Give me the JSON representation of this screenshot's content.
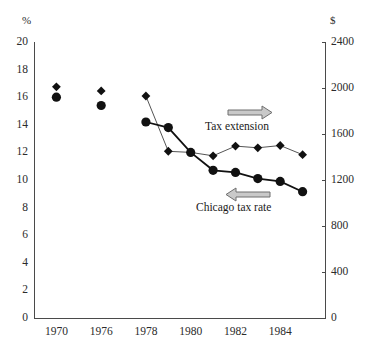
{
  "chart_data": {
    "type": "line",
    "title": "",
    "subtitle": "",
    "xlabel": "",
    "ylabel": "%",
    "y2label": "$",
    "grid": false,
    "legend_position": "inline-annotations",
    "x_tick_labels": [
      "1970",
      "1976",
      "1978",
      "1980",
      "1982",
      "1984"
    ],
    "x_tick_slots": [
      1,
      3,
      5,
      7,
      9,
      11
    ],
    "x_slot_count": 13,
    "left_axis": {
      "label": "%",
      "ticks": [
        "0",
        "2",
        "4",
        "6",
        "8",
        "10",
        "12",
        "14",
        "16",
        "18",
        "20"
      ],
      "values": [
        0,
        2,
        4,
        6,
        8,
        10,
        12,
        14,
        16,
        18,
        20
      ],
      "ylim": [
        0,
        20
      ]
    },
    "right_axis": {
      "label": "$",
      "ticks": [
        "0",
        "400",
        "800",
        "1200",
        "1600",
        "2000",
        "2400"
      ],
      "values": [
        0,
        400,
        800,
        1200,
        1600,
        2000,
        2400
      ],
      "ylim": [
        0,
        2400
      ]
    },
    "series": [
      {
        "name": "Tax extension",
        "axis": "right",
        "marker": "diamond",
        "color": "#111111",
        "line_color": "#555555",
        "points": [
          {
            "x_slot": 1,
            "x_label": "1970",
            "value": 2010,
            "connected": false
          },
          {
            "x_slot": 3,
            "x_label": "1976",
            "value": 1975,
            "connected": false
          },
          {
            "x_slot": 5,
            "x_label": "1978",
            "value": 1930,
            "connected": true
          },
          {
            "x_slot": 6,
            "x_label": "1979",
            "value": 1450,
            "connected": true
          },
          {
            "x_slot": 7,
            "x_label": "1980",
            "value": 1440,
            "connected": true
          },
          {
            "x_slot": 8,
            "x_label": "1981",
            "value": 1410,
            "connected": true
          },
          {
            "x_slot": 9,
            "x_label": "1982",
            "value": 1495,
            "connected": true
          },
          {
            "x_slot": 10,
            "x_label": "1983",
            "value": 1480,
            "connected": true
          },
          {
            "x_slot": 11,
            "x_label": "1984",
            "value": 1500,
            "connected": true
          },
          {
            "x_slot": 12,
            "x_label": "1985",
            "value": 1420,
            "connected": true
          }
        ]
      },
      {
        "name": "Chicago tax rate",
        "axis": "left",
        "marker": "circle",
        "color": "#111111",
        "line_color": "#111111",
        "points": [
          {
            "x_slot": 1,
            "x_label": "1970",
            "value": 16.0,
            "connected": false
          },
          {
            "x_slot": 3,
            "x_label": "1976",
            "value": 15.4,
            "connected": false
          },
          {
            "x_slot": 5,
            "x_label": "1978",
            "value": 14.2,
            "connected": true
          },
          {
            "x_slot": 6,
            "x_label": "1979",
            "value": 13.8,
            "connected": true
          },
          {
            "x_slot": 7,
            "x_label": "1980",
            "value": 12.0,
            "connected": true
          },
          {
            "x_slot": 8,
            "x_label": "1981",
            "value": 10.7,
            "connected": true
          },
          {
            "x_slot": 9,
            "x_label": "1982",
            "value": 10.55,
            "connected": true
          },
          {
            "x_slot": 10,
            "x_label": "1983",
            "value": 10.1,
            "connected": true
          },
          {
            "x_slot": 11,
            "x_label": "1984",
            "value": 9.9,
            "connected": true
          },
          {
            "x_slot": 12,
            "x_label": "1985",
            "value": 9.15,
            "connected": true
          }
        ]
      }
    ],
    "annotations": [
      {
        "name": "tax-extension",
        "text": "Tax extension",
        "arrow_direction": "right",
        "arrow_color": "#888888"
      },
      {
        "name": "chicago-tax-rate",
        "text": "Chicago tax rate",
        "arrow_direction": "left",
        "arrow_color": "#888888"
      }
    ]
  }
}
